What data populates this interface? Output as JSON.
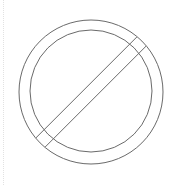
{
  "canvas": {
    "width": 180,
    "height": 185,
    "background_color": "#ffffff",
    "alt_text": "Prohibition sign outline: two concentric circles with a diagonal slash band"
  },
  "colors": {
    "stroke": "#6a6a6a",
    "stroke_light": "#7d7d7d",
    "guide": "#e2e2e2",
    "fill": "none"
  },
  "figure": {
    "name": "prohibition-sign-outline",
    "stroke_width": 1,
    "outer_circle": {
      "cx": 91,
      "cy": 92,
      "r": 72
    },
    "inner_circle": {
      "cx": 91,
      "cy": 91,
      "r": 61
    },
    "slash_band": {
      "angle_deg": -45,
      "band_width": 13,
      "start_x": 32,
      "start_y": 151,
      "end_x": 151,
      "end_y": 32
    }
  },
  "left_guide": {
    "x": 3,
    "style": "dotted",
    "color": "#e2e2e2"
  }
}
